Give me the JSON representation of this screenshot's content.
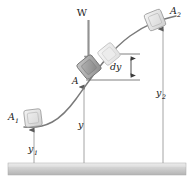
{
  "figure": {
    "background_color": "#ffffff",
    "curve_color": "#6d6d6d",
    "ground_color": "#c9c9c9",
    "leader_color": "#8a8a8a",
    "block_fill": "#e2e2e2",
    "block_fill_dark": "#9c9c9c",
    "block_stroke": "#8f8f8f"
  },
  "labels": {
    "weight": "W",
    "block_start": "A",
    "block_start_sub": "1",
    "block_end": "A",
    "block_end_sub": "2",
    "point_a": "A",
    "height_start": "y",
    "height_start_sub": "1",
    "height_mid": "y",
    "height_end": "y",
    "height_end_sub": "2",
    "differential": "dy"
  },
  "geometry": {
    "ground_y": 163,
    "ground_height": 12,
    "curve_path": "M 24 127 C 46 129, 60 121, 76 99 C 92 77, 108 52, 130 36 C 145 25, 158 20, 172 17",
    "blocks": [
      {
        "name": "A1",
        "cx": 33,
        "cy": 118,
        "size": 17,
        "rotate": -8,
        "shade": "light"
      },
      {
        "name": "A-current",
        "cx": 90,
        "cy": 66,
        "size": 19,
        "rotate": -38,
        "shade": "dark"
      },
      {
        "name": "A-ghost",
        "cx": 109,
        "cy": 54,
        "size": 18,
        "rotate": -38,
        "shade": "ghost"
      },
      {
        "name": "A2",
        "cx": 155,
        "cy": 20,
        "size": 18,
        "rotate": -22,
        "shade": "light"
      }
    ],
    "verticals": [
      {
        "name": "y1",
        "x": 34,
        "top": 129,
        "bottom": 163
      },
      {
        "name": "y",
        "x": 84,
        "top": 86,
        "bottom": 163
      },
      {
        "name": "y2",
        "x": 163,
        "top": 28,
        "bottom": 163
      }
    ],
    "dy_bracket": {
      "x": 130,
      "top": 54,
      "bottom": 80
    }
  }
}
